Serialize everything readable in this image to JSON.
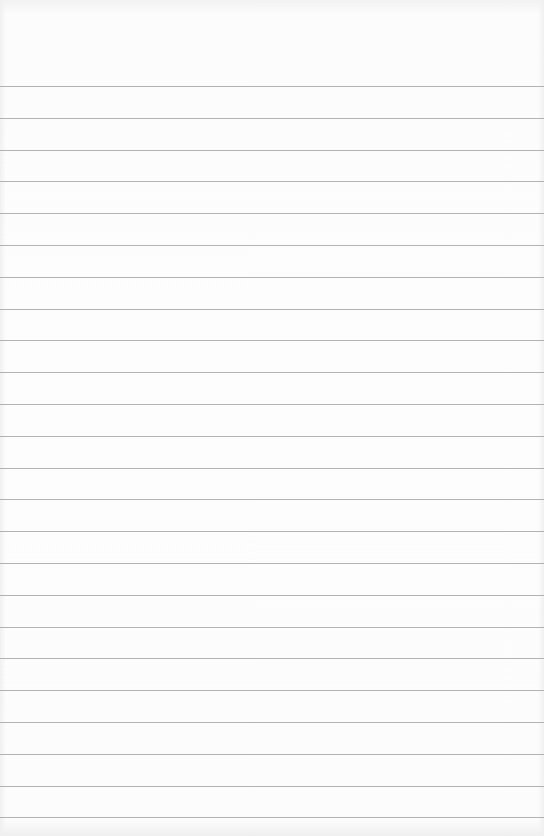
{
  "notepad": {
    "type": "ruled-paper",
    "background_color": "#fbfbfb",
    "line_color": "#a6a6a6",
    "line_count": 24,
    "first_line_y": 86,
    "line_spacing": 31.8
  }
}
